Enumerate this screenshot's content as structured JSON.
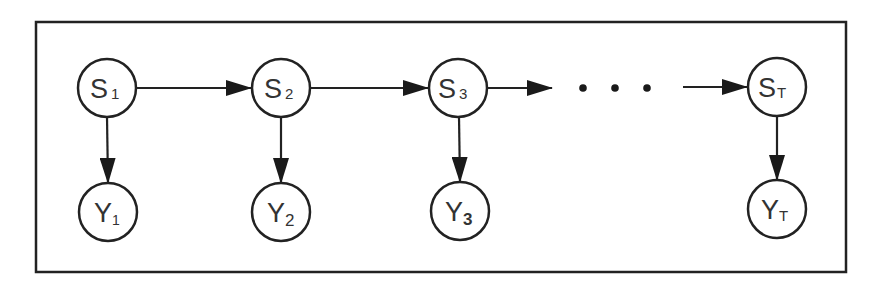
{
  "diagram": {
    "type": "hidden-markov-model",
    "states": [
      {
        "id": "S1",
        "base": "S",
        "sub": "1",
        "cx": 107,
        "cy": 88
      },
      {
        "id": "S2",
        "base": "S",
        "sub": "2",
        "cx": 281,
        "cy": 88
      },
      {
        "id": "S3",
        "base": "S",
        "sub": "3",
        "cx": 458,
        "cy": 88
      },
      {
        "id": "ST",
        "base": "S",
        "sub": "T",
        "cx": 777,
        "cy": 87
      }
    ],
    "observations": [
      {
        "id": "Y1",
        "base": "Y",
        "sub": "1",
        "cx": 108,
        "cy": 212
      },
      {
        "id": "Y2",
        "base": "Y",
        "sub": "2",
        "cx": 281,
        "cy": 212
      },
      {
        "id": "Y3",
        "base": "Y",
        "sub": "3",
        "cx": 460,
        "cy": 211
      },
      {
        "id": "YT",
        "base": "Y",
        "sub": "T",
        "cx": 777,
        "cy": 209
      }
    ],
    "edges": [
      {
        "from": "S1",
        "to": "S2"
      },
      {
        "from": "S2",
        "to": "S3"
      },
      {
        "from": "S3",
        "to": "..."
      },
      {
        "from": "...",
        "to": "ST"
      },
      {
        "from": "S1",
        "to": "Y1"
      },
      {
        "from": "S2",
        "to": "Y2"
      },
      {
        "from": "S3",
        "to": "Y3"
      },
      {
        "from": "ST",
        "to": "YT"
      }
    ],
    "ellipsis": "• • •",
    "colors": {
      "stroke": "#222222",
      "background": "#ffffff",
      "text": "#333333"
    }
  }
}
